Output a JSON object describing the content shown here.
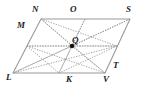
{
  "figure": {
    "type": "geometry-diagram",
    "shape": "parallelogram",
    "colors": {
      "outline": "#9a9a9a",
      "interior_lines": "#8d8d8d",
      "label_text": "#1c1c1c",
      "point_fill": "#111111",
      "background": "#ffffff"
    },
    "outline_points": [
      {
        "name": "N",
        "x": 41,
        "y": 19
      },
      {
        "name": "S",
        "x": 130,
        "y": 19
      },
      {
        "name": "V",
        "x": 105,
        "y": 73
      },
      {
        "name": "L",
        "x": 13,
        "y": 73
      }
    ],
    "midpoints": [
      {
        "name": "M",
        "x": 27,
        "y": 46
      },
      {
        "name": "O",
        "x": 85,
        "y": 19
      },
      {
        "name": "T",
        "x": 117,
        "y": 46
      },
      {
        "name": "K",
        "x": 59,
        "y": 73
      }
    ],
    "center_point": {
      "name": "Q",
      "x": 72,
      "y": 46
    },
    "interior_segments": [
      {
        "from": "N",
        "to": "V"
      },
      {
        "from": "L",
        "to": "S"
      },
      {
        "from": "O",
        "to": "K"
      },
      {
        "from": "M",
        "to": "T"
      },
      {
        "from": "Q",
        "to": "N"
      },
      {
        "from": "Q",
        "to": "S"
      },
      {
        "from": "Q",
        "to": "L"
      },
      {
        "from": "Q",
        "to": "V"
      },
      {
        "from": "Q",
        "to": "M"
      },
      {
        "from": "Q",
        "to": "O"
      },
      {
        "from": "Q",
        "to": "T"
      },
      {
        "from": "Q",
        "to": "K"
      },
      {
        "from": "M",
        "to": "V"
      },
      {
        "from": "N",
        "to": "T"
      },
      {
        "from": "L",
        "to": "T"
      },
      {
        "from": "M",
        "to": "K"
      },
      {
        "from": "K",
        "to": "T"
      }
    ],
    "labels": {
      "N": "N",
      "O": "O",
      "S": "S",
      "M": "M",
      "Q": "Q",
      "T": "T",
      "L": "L",
      "K": "K",
      "V": "V"
    },
    "label_positions": {
      "N": {
        "x": 32,
        "y": 5
      },
      "O": {
        "x": 70,
        "y": 5
      },
      "S": {
        "x": 126,
        "y": 5
      },
      "M": {
        "x": 17,
        "y": 21
      },
      "Q": {
        "x": 72,
        "y": 36
      },
      "T": {
        "x": 113,
        "y": 61
      },
      "L": {
        "x": 6,
        "y": 73
      },
      "K": {
        "x": 66,
        "y": 75
      },
      "V": {
        "x": 103,
        "y": 75
      }
    }
  }
}
